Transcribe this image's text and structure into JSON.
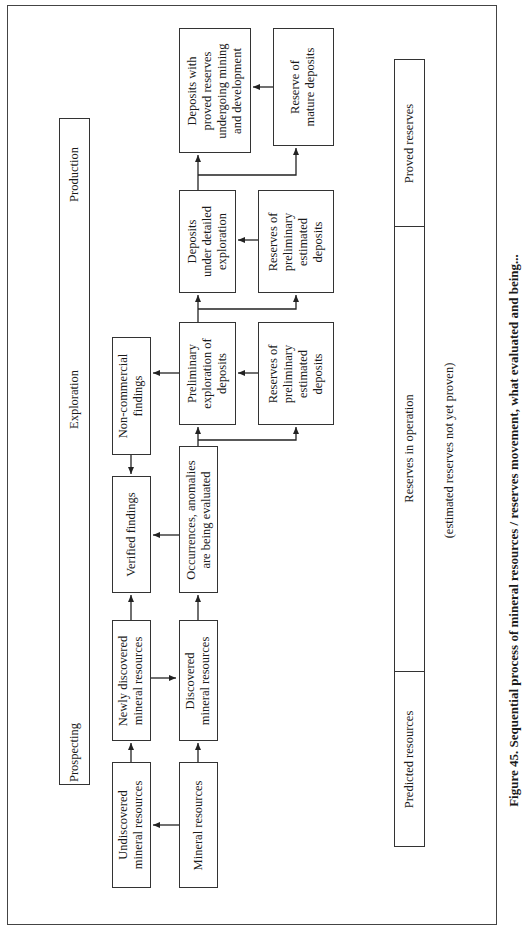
{
  "figure": {
    "caption": "Figure 45. Sequential process of mineral resources / reserves movement, what evaluated and being..."
  },
  "stages_bar": {
    "segments": [
      "Production",
      "Exploration",
      "Prospecting"
    ]
  },
  "reserves_bar": {
    "segments": [
      "Proved reserves",
      "Reserves in operation",
      "Predicted resources"
    ],
    "note": "(estimated reserves not yet proven)"
  },
  "nodes": {
    "deposits_proved": [
      "Deposits with",
      "proved reserves",
      "undergoing mining",
      "and development"
    ],
    "reserve_mature": [
      "Reserve of",
      "mature deposits"
    ],
    "deposits_detailed": [
      "Deposits",
      "under detailed",
      "exploration"
    ],
    "reserves_prelim_upper": [
      "Reserves of",
      "preliminary",
      "estimated",
      "deposits"
    ],
    "prelim_exploration": [
      "Preliminary",
      "exploration of",
      "deposits"
    ],
    "reserves_prelim_lower": [
      "Reserves of",
      "preliminary",
      "estimated",
      "deposits"
    ],
    "non_commercial": [
      "Non-commercial",
      "findings"
    ],
    "verified": [
      "Verified findings"
    ],
    "occurrences": [
      "Occurrences, anomalies",
      "are being evaluated"
    ],
    "newly_discovered": [
      "Newly discovered",
      "mineral resources"
    ],
    "discovered": [
      "Discovered",
      "mineral resources"
    ],
    "undiscovered": [
      "Undiscovered",
      "mineral resources"
    ],
    "mineral_resources": [
      "Mineral resources"
    ]
  },
  "edges": [
    {
      "from": "mineral_resources",
      "to": "undiscovered"
    },
    {
      "from": "undiscovered",
      "to": "newly_discovered"
    },
    {
      "from": "mineral_resources",
      "to": "discovered"
    },
    {
      "from": "newly_discovered",
      "to": "discovered"
    },
    {
      "from": "newly_discovered",
      "to": "verified"
    },
    {
      "from": "discovered",
      "to": "occurrences"
    },
    {
      "from": "occurrences",
      "to": "verified"
    },
    {
      "from": "non_commercial",
      "to": "verified"
    },
    {
      "from": "occurrences",
      "to": "prelim_exploration"
    },
    {
      "from": "occurrences",
      "to": "reserves_prelim_lower"
    },
    {
      "from": "prelim_exploration",
      "to": "non_commercial"
    },
    {
      "from": "reserves_prelim_lower",
      "to": "prelim_exploration"
    },
    {
      "from": "prelim_exploration",
      "to": "deposits_detailed"
    },
    {
      "from": "prelim_exploration",
      "to": "reserves_prelim_upper"
    },
    {
      "from": "reserves_prelim_upper",
      "to": "deposits_detailed"
    },
    {
      "from": "deposits_detailed",
      "to": "deposits_proved"
    },
    {
      "from": "deposits_detailed",
      "to": "reserve_mature"
    },
    {
      "from": "reserve_mature",
      "to": "deposits_proved"
    }
  ]
}
